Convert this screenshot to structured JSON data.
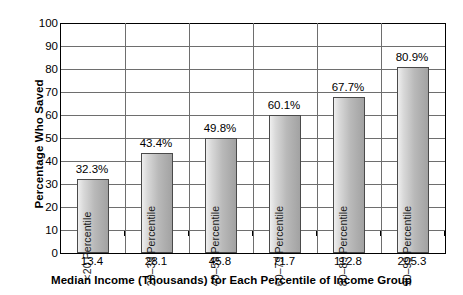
{
  "chart_data": {
    "type": "bar",
    "title": "",
    "xlabel": "Median Income (Thousands) for Each Percentile of Income Group",
    "ylabel": "Percentage Who Saved",
    "categories": [
      "13.4",
      "28.1",
      "45.8",
      "71.7",
      "112.8",
      "205.3"
    ],
    "bar_labels": [
      "<20 Percentile",
      "20–39 Percentile",
      "40–59 Percentile",
      "60–79 Percentile",
      "80–89 Percentile",
      "90–99 Percentile"
    ],
    "values": [
      32.3,
      43.4,
      49.8,
      60.1,
      67.7,
      80.9
    ],
    "value_labels": [
      "32.3%",
      "43.4%",
      "49.8%",
      "60.1%",
      "67.7%",
      "80.9%"
    ],
    "ylim": [
      0,
      100
    ],
    "ytick_values": [
      0,
      10,
      20,
      30,
      40,
      50,
      60,
      70,
      80,
      90,
      100
    ],
    "ytick_labels": [
      "0",
      "10",
      "20",
      "30",
      "40",
      "50",
      "60",
      "70",
      "80",
      "90",
      "100"
    ],
    "grid": true,
    "legend": false,
    "bar_fill_light": "#efefef",
    "bar_fill_dark": "#a2a2a2",
    "bar_edge_color": "#4a4a4a",
    "gridline_color": "#6e6e6e",
    "axis_color": "#000000",
    "background_color": "#ffffff"
  }
}
